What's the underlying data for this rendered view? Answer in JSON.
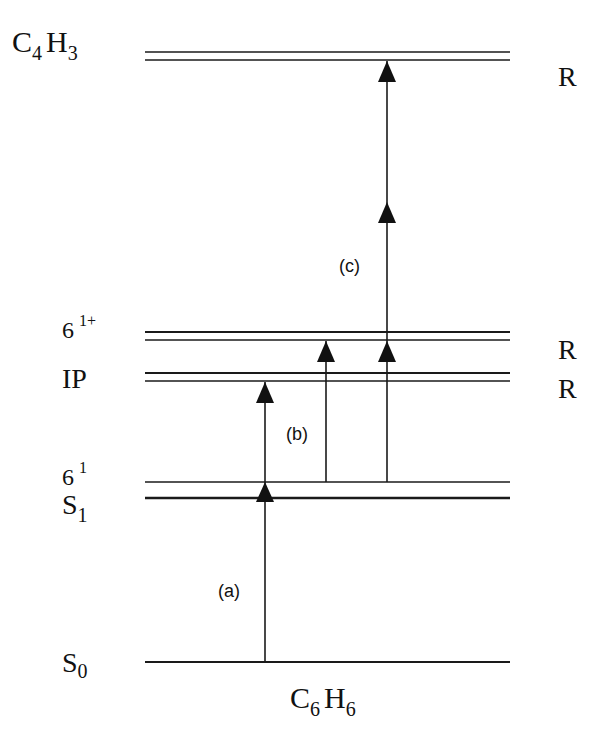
{
  "diagram": {
    "bottom_label": {
      "base": "C",
      "sub1": "6",
      "mid": "H",
      "sub2": "6"
    },
    "levels": [
      {
        "id": "C4H3",
        "label_base": "C",
        "label_sub1": "4",
        "label_mid": "H",
        "label_sub2": "3",
        "right_label": "R"
      },
      {
        "id": "6_1_plus",
        "label_base": "6",
        "label_sup": "1+",
        "right_label": "R"
      },
      {
        "id": "IP",
        "label_base": "IP",
        "right_label": "R"
      },
      {
        "id": "6_1",
        "label_base": "6",
        "label_sup": "1"
      },
      {
        "id": "S1",
        "label_base": "S",
        "label_sub": "1"
      },
      {
        "id": "S0",
        "label_base": "S",
        "label_sub": "0"
      }
    ],
    "transitions": [
      {
        "id": "a",
        "label": "(a)"
      },
      {
        "id": "b",
        "label": "(b)"
      },
      {
        "id": "c",
        "label": "(c)"
      }
    ]
  }
}
